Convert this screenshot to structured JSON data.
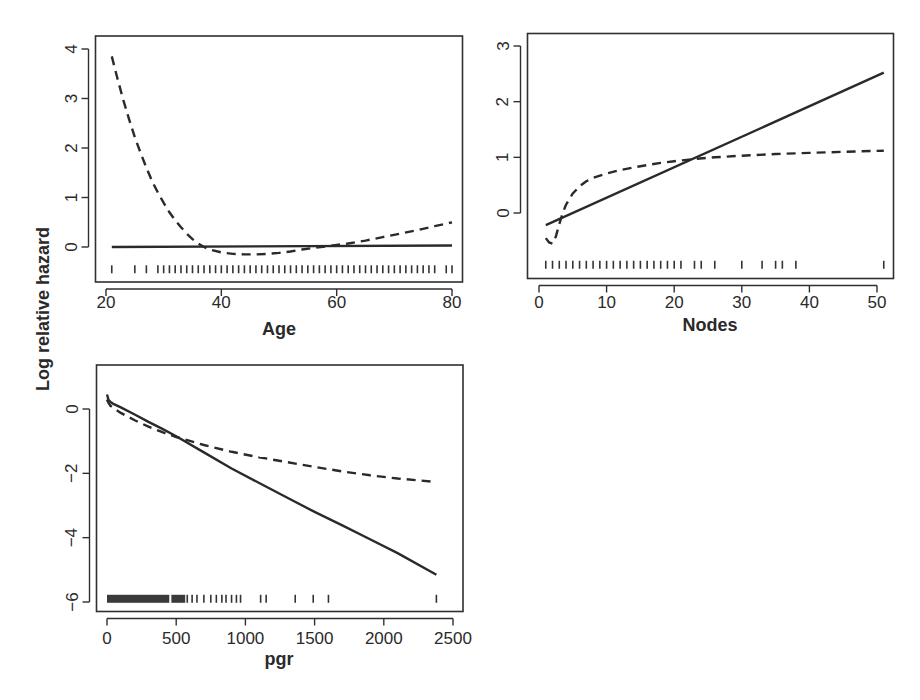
{
  "chart_data": {
    "type": "line",
    "ylabel": "Log relative hazard",
    "legend": "none",
    "grid": false,
    "panels": [
      {
        "id": "age",
        "xlabel": "Age",
        "xlim": [
          19,
          82
        ],
        "ylim": [
          -0.7,
          4.25
        ],
        "xticks": [
          20,
          40,
          60,
          80
        ],
        "yticks": [
          0,
          1,
          2,
          3,
          4
        ],
        "rug_y": -0.45,
        "rug": [
          21,
          25,
          27,
          29,
          30,
          31,
          32,
          33,
          34,
          35,
          36,
          37,
          38,
          39,
          40,
          41,
          42,
          43,
          44,
          45,
          46,
          47,
          48,
          49,
          50,
          51,
          52,
          53,
          54,
          55,
          56,
          57,
          58,
          59,
          60,
          61,
          62,
          63,
          64,
          65,
          66,
          67,
          68,
          69,
          70,
          71,
          72,
          73,
          74,
          75,
          76,
          77,
          79,
          80
        ],
        "series": [
          {
            "name": "linear",
            "style": "solid",
            "x": [
              21,
              80
            ],
            "y": [
              0.0,
              0.03
            ]
          },
          {
            "name": "spline",
            "style": "dashed",
            "x": [
              21,
              22,
              23,
              24,
              25,
              26,
              27,
              28,
              29,
              30,
              31,
              32,
              33,
              34,
              35,
              36,
              37,
              38,
              40,
              42,
              44,
              46,
              48,
              50,
              52,
              54,
              56,
              58,
              60,
              62,
              65,
              68,
              71,
              74,
              77,
              80
            ],
            "y": [
              3.85,
              3.4,
              2.97,
              2.58,
              2.22,
              1.9,
              1.6,
              1.33,
              1.1,
              0.89,
              0.7,
              0.54,
              0.4,
              0.27,
              0.16,
              0.07,
              0.0,
              -0.05,
              -0.11,
              -0.14,
              -0.15,
              -0.15,
              -0.14,
              -0.12,
              -0.09,
              -0.05,
              -0.02,
              0.01,
              0.04,
              0.07,
              0.13,
              0.2,
              0.27,
              0.34,
              0.42,
              0.5
            ]
          }
        ]
      },
      {
        "id": "nodes",
        "xlabel": "Nodes",
        "xlim": [
          -1.5,
          52.5
        ],
        "ylim": [
          -1.17,
          3.25
        ],
        "xticks": [
          0,
          10,
          20,
          30,
          40,
          50
        ],
        "yticks": [
          0,
          1,
          2,
          3
        ],
        "rug_y": -0.93,
        "rug": [
          1,
          2,
          3,
          4,
          5,
          6,
          7,
          8,
          9,
          10,
          11,
          12,
          13,
          14,
          15,
          16,
          17,
          18,
          19,
          20,
          21,
          23,
          24,
          26,
          30,
          33,
          35,
          36,
          38,
          51
        ],
        "series": [
          {
            "name": "linear",
            "style": "solid",
            "x": [
              1,
              51
            ],
            "y": [
              -0.22,
              2.52
            ]
          },
          {
            "name": "spline",
            "style": "dashed",
            "x": [
              1,
              1.5,
              2,
              2.5,
              3,
              3.5,
              4,
              5,
              6,
              7,
              8,
              10,
              12,
              15,
              18,
              20,
              23,
              26,
              30,
              35,
              40,
              45,
              51
            ],
            "y": [
              -0.45,
              -0.53,
              -0.55,
              -0.42,
              -0.2,
              0.0,
              0.15,
              0.35,
              0.48,
              0.57,
              0.63,
              0.71,
              0.77,
              0.84,
              0.9,
              0.93,
              0.97,
              1.0,
              1.03,
              1.06,
              1.08,
              1.1,
              1.12
            ]
          }
        ]
      },
      {
        "id": "pgr",
        "xlabel": "pgr",
        "xlim": [
          -80,
          2550
        ],
        "ylim": [
          -6.25,
          1.35
        ],
        "xticks": [
          0,
          500,
          1000,
          1500,
          2000,
          2500
        ],
        "yticks": [
          -6,
          -4,
          -2,
          0
        ],
        "rug_y": -5.9,
        "rug_dense_ranges": [
          [
            0,
            450
          ],
          [
            465,
            565
          ]
        ],
        "rug": [
          580,
          615,
          650,
          700,
          750,
          790,
          830,
          860,
          900,
          935,
          965,
          1110,
          1150,
          1360,
          1490,
          1600,
          2380
        ],
        "series": [
          {
            "name": "linear",
            "style": "solid",
            "x": [
              0,
              10,
              25,
              50,
              100,
              200,
              300,
              400,
              500,
              700,
              900,
              1100,
              1300,
              1500,
              1700,
              1900,
              2100,
              2380
            ],
            "y": [
              0.45,
              0.3,
              0.22,
              0.15,
              0.05,
              -0.17,
              -0.4,
              -0.62,
              -0.85,
              -1.35,
              -1.85,
              -2.3,
              -2.75,
              -3.2,
              -3.62,
              -4.05,
              -4.48,
              -5.15
            ]
          },
          {
            "name": "spline",
            "style": "dashed",
            "x": [
              0,
              10,
              25,
              50,
              100,
              200,
              300,
              400,
              500,
              700,
              900,
              1100,
              1300,
              1500,
              1700,
              1900,
              2100,
              2380
            ],
            "y": [
              0.3,
              0.2,
              0.1,
              0.02,
              -0.12,
              -0.35,
              -0.55,
              -0.72,
              -0.87,
              -1.12,
              -1.33,
              -1.5,
              -1.65,
              -1.8,
              -1.94,
              -2.06,
              -2.16,
              -2.27
            ]
          }
        ]
      }
    ]
  }
}
